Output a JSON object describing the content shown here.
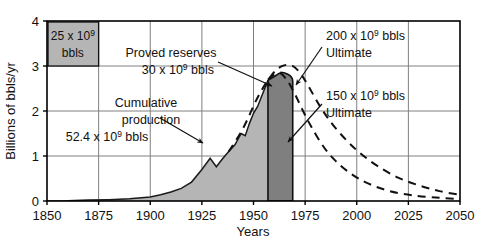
{
  "chart_data": {
    "type": "area",
    "title": "",
    "xlabel": "Years",
    "ylabel": "Billions of bbls/yr",
    "xlim": [
      1850,
      2050
    ],
    "ylim": [
      0,
      4
    ],
    "xticks": [
      1850,
      1875,
      1900,
      1925,
      1950,
      1975,
      2000,
      2025,
      2050
    ],
    "xtick_labels": [
      "1850",
      "1875",
      "1900",
      "1925",
      "1950",
      "1975",
      "2000",
      "2025",
      "2050"
    ],
    "yticks": [
      0,
      1,
      2,
      3,
      4
    ],
    "ytick_labels": [
      "0",
      "1",
      "2",
      "3",
      "4"
    ],
    "grid": true,
    "series": [
      {
        "name": "Cumulative production",
        "style": "filled-area-light",
        "fill": "#b5b5b5",
        "x": [
          1850,
          1860,
          1870,
          1880,
          1890,
          1900,
          1905,
          1910,
          1915,
          1920,
          1925,
          1929,
          1932,
          1935,
          1938,
          1941,
          1944,
          1946,
          1948,
          1950,
          1952,
          1955,
          1957
        ],
        "y": [
          0.0,
          0.005,
          0.02,
          0.03,
          0.05,
          0.09,
          0.14,
          0.2,
          0.28,
          0.42,
          0.7,
          0.95,
          0.76,
          0.94,
          1.1,
          1.25,
          1.5,
          1.45,
          1.72,
          1.95,
          2.1,
          2.45,
          2.68
        ]
      },
      {
        "name": "Proved reserves",
        "style": "filled-block-dark",
        "fill": "#7f7f7f",
        "x_start": 1957,
        "x_end": 1969,
        "y_top": 2.86,
        "y_peak_x": 1962
      },
      {
        "name": "200 x 10^9 bbls Ultimate",
        "style": "dashed",
        "x": [
          1938,
          1945,
          1952,
          1958,
          1963,
          1968,
          1972,
          1976,
          1982,
          1988,
          1995,
          2002,
          2010,
          2020,
          2030,
          2040,
          2050
        ],
        "y": [
          1.1,
          1.62,
          2.3,
          2.75,
          2.98,
          3.02,
          2.88,
          2.6,
          2.12,
          1.72,
          1.35,
          1.05,
          0.78,
          0.52,
          0.35,
          0.22,
          0.14
        ]
      },
      {
        "name": "150 x 10^9 bbls Ultimate",
        "style": "dashed",
        "x": [
          1957,
          1962,
          1966,
          1970,
          1974,
          1978,
          1984,
          1990,
          1998,
          2006,
          2016,
          2028,
          2040,
          2050
        ],
        "y": [
          2.7,
          2.85,
          2.7,
          2.38,
          2.0,
          1.65,
          1.2,
          0.88,
          0.58,
          0.38,
          0.22,
          0.12,
          0.07,
          0.04
        ]
      }
    ],
    "annotations": [
      {
        "name": "reserves-box",
        "line1": "25 x 10",
        "sup1": "9",
        "line2": "bbls",
        "x_range": [
          1850,
          1875
        ],
        "y_range": [
          3,
          4
        ],
        "fill": "#b5b5b5"
      },
      {
        "name": "proved-reserves-label",
        "line1": "Proved reserves",
        "line2_pre": "30 x 10",
        "line2_sup": "9",
        "line2_post": " bbls"
      },
      {
        "name": "cumulative-production-label",
        "line1": "Cumulative",
        "line2": "production",
        "line3_pre": "52.4 x 10",
        "line3_sup": "9",
        "line3_post": " bbls"
      },
      {
        "name": "ultimate-200-label",
        "line1_pre": "200 x 10",
        "line1_sup": "9",
        "line1_post": " bbls",
        "line2": "Ultimate"
      },
      {
        "name": "ultimate-150-label",
        "line1_pre": "150 x 10",
        "line1_sup": "9",
        "line1_post": " bbls",
        "line2": "Ultimate"
      }
    ],
    "colors": {
      "axis": "#000000",
      "grid": "#808080",
      "area_light": "#b5b5b5",
      "area_dark": "#7f7f7f",
      "text": "#111111"
    }
  }
}
